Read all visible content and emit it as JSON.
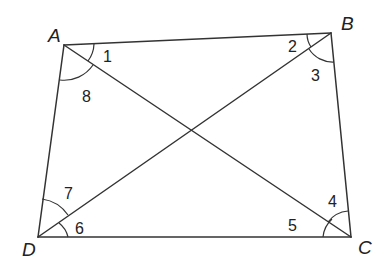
{
  "diagram": {
    "type": "quadrilateral-with-diagonals",
    "vertices": [
      {
        "id": "A",
        "x": 64,
        "y": 45,
        "lx": 48,
        "ly": 42
      },
      {
        "id": "B",
        "x": 331,
        "y": 33,
        "lx": 341,
        "ly": 30
      },
      {
        "id": "C",
        "x": 351,
        "y": 237,
        "lx": 358,
        "ly": 254
      },
      {
        "id": "D",
        "x": 38,
        "y": 237,
        "lx": 22,
        "ly": 256
      }
    ],
    "edges": [
      [
        "A",
        "B"
      ],
      [
        "B",
        "C"
      ],
      [
        "C",
        "D"
      ],
      [
        "D",
        "A"
      ],
      [
        "A",
        "C"
      ],
      [
        "B",
        "D"
      ]
    ],
    "angles": [
      {
        "label": "1",
        "x": 103,
        "y": 62
      },
      {
        "label": "2",
        "x": 288,
        "y": 52
      },
      {
        "label": "3",
        "x": 311,
        "y": 81
      },
      {
        "label": "4",
        "x": 328,
        "y": 207
      },
      {
        "label": "5",
        "x": 288,
        "y": 231
      },
      {
        "label": "6",
        "x": 75,
        "y": 234
      },
      {
        "label": "7",
        "x": 64,
        "y": 199
      },
      {
        "label": "8",
        "x": 82,
        "y": 102
      }
    ]
  }
}
